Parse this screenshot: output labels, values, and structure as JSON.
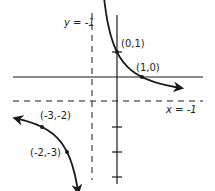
{
  "figure": {
    "type": "rational-function-graph"
  },
  "asymptotes": {
    "vertical": {
      "label": "y = -1",
      "value": -1
    },
    "horizontal": {
      "label": "x = -1",
      "value": -1
    }
  },
  "points": [
    {
      "label": "(0,1)",
      "x": 0,
      "y": 1
    },
    {
      "label": "(1,0)",
      "x": 1,
      "y": 0
    },
    {
      "label": "(-3,-2)",
      "x": -3,
      "y": -2
    },
    {
      "label": "(-2,-3)",
      "x": -2,
      "y": -3
    }
  ],
  "y_axis_ticks": [
    1,
    -2,
    -3,
    -4
  ],
  "colors": {
    "ink": "#1a1a1a",
    "background": "#ffffff"
  }
}
